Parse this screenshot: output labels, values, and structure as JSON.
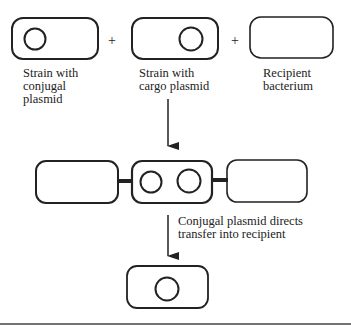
{
  "diagram": {
    "top_row": {
      "cells": [
        {
          "label_lines": [
            "Strain with",
            "conjugal",
            "plasmid"
          ],
          "plasmids": 1
        },
        {
          "label_lines": [
            "Strain with",
            "cargo plasmid"
          ],
          "plasmids": 1
        },
        {
          "label_lines": [
            "Recipient",
            "bacterium"
          ],
          "plasmids": 0
        }
      ],
      "operators": [
        "+",
        "+"
      ]
    },
    "middle_row": {
      "description": "Mating complex: three cells joined by conjugation bridges; middle cell holds both plasmids",
      "cells": [
        {
          "plasmids": 0
        },
        {
          "plasmids": 2
        },
        {
          "plasmids": 0
        }
      ]
    },
    "transfer_step": {
      "caption_lines": [
        "Conjugal plasmid directs",
        "transfer into recipient"
      ]
    },
    "bottom_row": {
      "cells": [
        {
          "plasmids": 1
        }
      ]
    },
    "colors": {
      "stroke": "#222222",
      "background": "#ffffff"
    }
  }
}
